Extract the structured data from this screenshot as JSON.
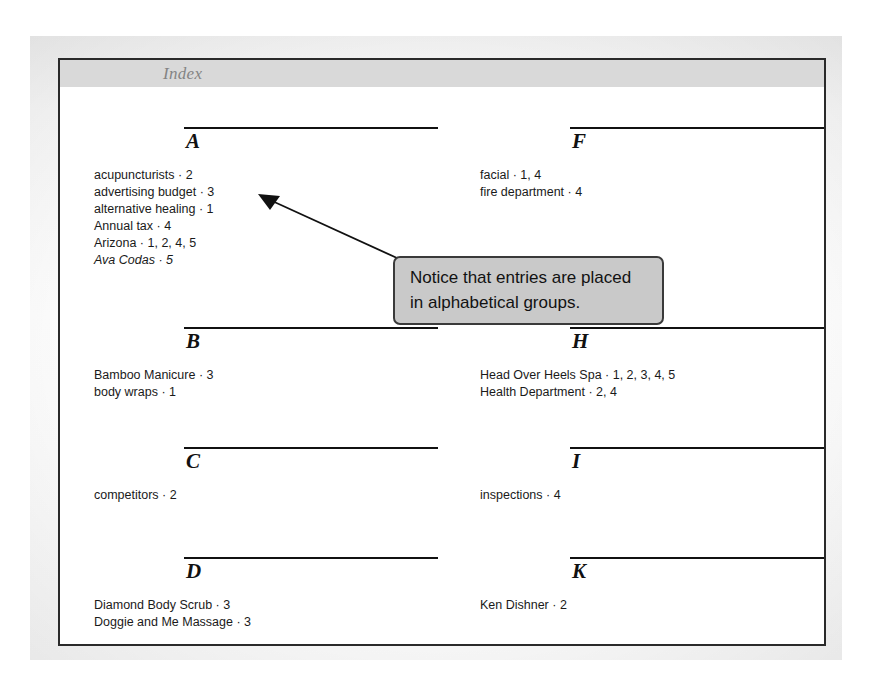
{
  "page": {
    "running_head": "Index"
  },
  "annotation": {
    "line1": "Notice that entries are placed",
    "line2": "in alphabetical groups.",
    "arrow_icon": "arrow-pointer-icon",
    "target": "A"
  },
  "index": {
    "columns": [
      {
        "side": "left",
        "groups": [
          {
            "letter": "A",
            "entries": [
              {
                "text": "acupuncturists · 2",
                "italic": false
              },
              {
                "text": "advertising budget · 3",
                "italic": false
              },
              {
                "text": "alternative healing · 1",
                "italic": false
              },
              {
                "text": "Annual tax · 4",
                "italic": false
              },
              {
                "text": "Arizona · 1, 2, 4, 5",
                "italic": false
              },
              {
                "text": "Ava Codas · 5",
                "italic": true
              }
            ]
          },
          {
            "letter": "B",
            "entries": [
              {
                "text": "Bamboo Manicure · 3",
                "italic": false
              },
              {
                "text": "body wraps · 1",
                "italic": false
              }
            ]
          },
          {
            "letter": "C",
            "entries": [
              {
                "text": "competitors · 2",
                "italic": false
              }
            ]
          },
          {
            "letter": "D",
            "entries": [
              {
                "text": "Diamond Body Scrub · 3",
                "italic": false
              },
              {
                "text": "Doggie and Me Massage · 3",
                "italic": false
              }
            ]
          }
        ]
      },
      {
        "side": "right",
        "groups": [
          {
            "letter": "F",
            "entries": [
              {
                "text": "facial · 1, 4",
                "italic": false
              },
              {
                "text": "fire department · 4",
                "italic": false
              }
            ]
          },
          {
            "letter": "H",
            "entries": [
              {
                "text": "Head Over Heels Spa · 1, 2, 3, 4, 5",
                "italic": false
              },
              {
                "text": "Health Department · 2, 4",
                "italic": false
              }
            ]
          },
          {
            "letter": "I",
            "entries": [
              {
                "text": "inspections · 4",
                "italic": false
              }
            ]
          },
          {
            "letter": "K",
            "entries": [
              {
                "text": "Ken Dishner · 2",
                "italic": false
              }
            ]
          }
        ]
      }
    ]
  },
  "colors": {
    "page_border": "#2a2a2a",
    "header_band": "#d9d9d9",
    "header_text": "#848484",
    "rule": "#111111",
    "callout_fill": "#c9c9c9",
    "callout_border": "#3a3a3a",
    "body_text": "#1a1a1a"
  },
  "layout": {
    "group_tops": [
      40,
      240,
      360,
      470
    ]
  }
}
